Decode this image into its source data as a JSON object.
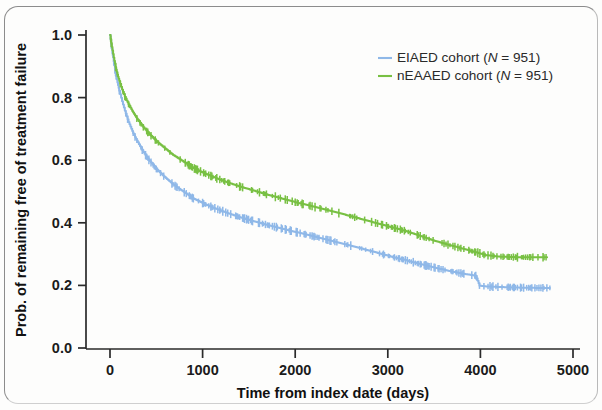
{
  "figure": {
    "background_color": "#fdfdfc",
    "frame_color": "#8c8c8c"
  },
  "chart_data": {
    "type": "line",
    "title": "",
    "subtitle": "",
    "xlabel": "Time from index date (days)",
    "ylabel": "Prob. of remaining free of treatment failure",
    "xlim": [
      0,
      5000
    ],
    "ylim": [
      0.0,
      1.0
    ],
    "xticks": [
      0,
      1000,
      2000,
      3000,
      4000,
      5000
    ],
    "xtick_labels": [
      "0",
      "1000",
      "2000",
      "3000",
      "4000",
      "5000"
    ],
    "yticks": [
      0.0,
      0.2,
      0.4,
      0.6,
      0.8,
      1.0
    ],
    "ytick_labels": [
      "0.0",
      "0.2",
      "0.4",
      "0.6",
      "0.8",
      "1.0"
    ],
    "grid": false,
    "legend_position": "top-right",
    "curve_style": "kaplan-meier step with censoring ticks",
    "series": [
      {
        "name": "EIAED cohort",
        "legend_text": "EIAED cohort (N = 951)",
        "n_label": "N = 951",
        "n_value": 951,
        "color": "#8fb8e8",
        "x": [
          0,
          20,
          40,
          60,
          80,
          100,
          130,
          160,
          200,
          250,
          300,
          360,
          420,
          500,
          580,
          680,
          780,
          900,
          1000,
          1100,
          1250,
          1400,
          1550,
          1700,
          1850,
          2000,
          2150,
          2300,
          2450,
          2600,
          2750,
          2900,
          3050,
          3200,
          3350,
          3500,
          3650,
          3800,
          3950,
          3990,
          4050,
          4200,
          4400,
          4600,
          4750
        ],
        "y": [
          1.0,
          0.955,
          0.915,
          0.878,
          0.848,
          0.822,
          0.788,
          0.758,
          0.722,
          0.686,
          0.657,
          0.626,
          0.601,
          0.572,
          0.549,
          0.523,
          0.502,
          0.478,
          0.463,
          0.45,
          0.433,
          0.418,
          0.405,
          0.393,
          0.382,
          0.371,
          0.36,
          0.349,
          0.338,
          0.327,
          0.315,
          0.303,
          0.291,
          0.28,
          0.268,
          0.257,
          0.247,
          0.238,
          0.231,
          0.199,
          0.197,
          0.195,
          0.193,
          0.192,
          0.192
        ]
      },
      {
        "name": "nEAAED cohort",
        "legend_text": "nEAAED cohort (N = 951)",
        "n_label": "N = 951",
        "n_value": 951,
        "color": "#78c043",
        "x": [
          0,
          20,
          40,
          60,
          80,
          100,
          130,
          160,
          200,
          250,
          300,
          360,
          420,
          500,
          580,
          680,
          780,
          900,
          1000,
          1100,
          1250,
          1400,
          1550,
          1700,
          1850,
          2000,
          2150,
          2300,
          2450,
          2600,
          2750,
          2900,
          3050,
          3200,
          3350,
          3500,
          3650,
          3800,
          3950,
          4050,
          4200,
          4400,
          4600,
          4720
        ],
        "y": [
          1.0,
          0.962,
          0.928,
          0.898,
          0.874,
          0.853,
          0.826,
          0.803,
          0.779,
          0.752,
          0.729,
          0.705,
          0.685,
          0.661,
          0.641,
          0.617,
          0.598,
          0.575,
          0.561,
          0.548,
          0.531,
          0.516,
          0.503,
          0.49,
          0.478,
          0.466,
          0.455,
          0.444,
          0.433,
          0.421,
          0.409,
          0.397,
          0.385,
          0.373,
          0.358,
          0.343,
          0.33,
          0.318,
          0.306,
          0.297,
          0.292,
          0.29,
          0.29,
          0.29
        ]
      }
    ],
    "censoring_marks": {
      "description": "vertical tick marks along each curve indicating censored observations"
    }
  }
}
